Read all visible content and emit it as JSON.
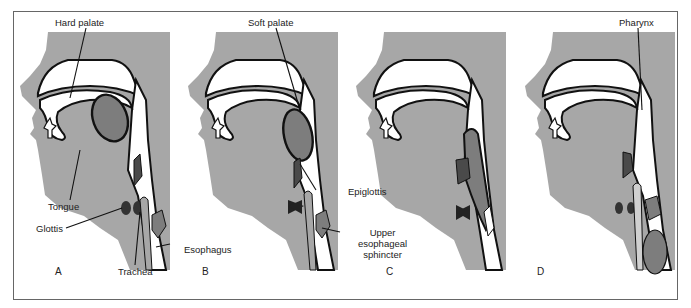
{
  "figure": {
    "colors": {
      "tissue": "#a7a7a7",
      "dark_structures": "#4a4a4a",
      "mid_structures": "#7d7d7d",
      "outline": "#111111",
      "background": "#ffffff"
    },
    "panels": [
      {
        "id": "A",
        "letter": "A"
      },
      {
        "id": "B",
        "letter": "B"
      },
      {
        "id": "C",
        "letter": "C"
      },
      {
        "id": "D",
        "letter": "D"
      }
    ],
    "labels": {
      "hard_palate": "Hard palate",
      "tongue": "Tongue",
      "glottis": "Glottis",
      "trachea": "Trachea",
      "esophagus": "Esophagus",
      "soft_palate": "Soft palate",
      "epiglottis": "Epiglottis",
      "upper_esophageal_sphincter_line1": "Upper",
      "upper_esophageal_sphincter_line2": "esophageal",
      "upper_esophageal_sphincter_line3": "sphincter",
      "pharynx": "Pharynx"
    }
  }
}
